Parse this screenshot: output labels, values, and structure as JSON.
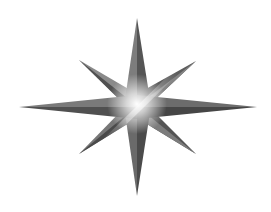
{
  "graphic": {
    "type": "eight-pointed-star",
    "center": [
      137,
      106
    ],
    "tips": {
      "north": [
        137,
        18
      ],
      "south": [
        137,
        196
      ],
      "west": [
        19,
        107
      ],
      "east": [
        257,
        107
      ],
      "north_west": [
        79,
        60
      ],
      "north_east": [
        196,
        61
      ],
      "south_west": [
        79,
        154
      ],
      "south_east": [
        196,
        154
      ]
    },
    "colors": {
      "background": "#ffffff",
      "light_face": "#8a8a8a",
      "dark_face": "#4e4e4e",
      "mid_face": "#6b6b6b",
      "highlight": "#ffffff"
    }
  }
}
